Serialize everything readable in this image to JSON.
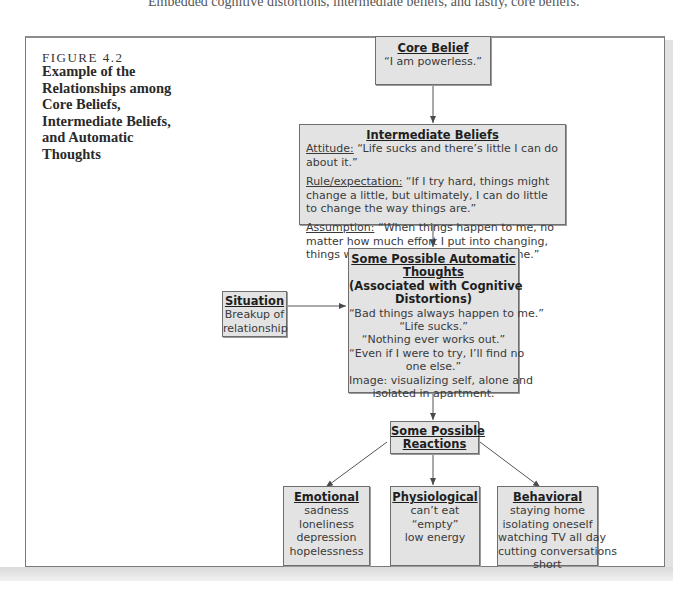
{
  "page": {
    "caption": "Embedded cognitive distortions, intermediate beliefs, and lastly, core beliefs."
  },
  "figure": {
    "label": "FIGURE 4.2",
    "title": "Example of the Relationships among Core Beliefs, Intermediate Beliefs, and Automatic Thoughts"
  },
  "diagram": {
    "core_belief": {
      "title": "Core Belief",
      "text": "“I am powerless.”"
    },
    "intermediate_beliefs": {
      "title": "Intermediate Beliefs",
      "items": [
        {
          "label": "Attitude:",
          "text": " “Life sucks and there’s little I can do about it.”"
        },
        {
          "label": "Rule/expectation:",
          "text": " “If I try hard, things might change a little, but ultimately, I can do little to change the way things are.”"
        },
        {
          "label": "Assumption:",
          "text": " “When things happen to me, no matter how much effort I put into changing, things will more or less remain the same.”"
        }
      ]
    },
    "situation": {
      "title": "Situation",
      "lines": [
        "Breakup of",
        "relationship"
      ]
    },
    "automatic_thoughts": {
      "title_lines": [
        "Some Possible Automatic",
        "Thoughts"
      ],
      "subtitle_lines": [
        "(Associated with Cognitive",
        "Distortions)"
      ],
      "lines": [
        "“Bad things always happen to me.”",
        "“Life sucks.”",
        "“Nothing ever works out.”",
        "“Even if I were to try, I’ll find no",
        "one else.”",
        "Image: visualizing self, alone and",
        "isolated in apartment."
      ]
    },
    "reactions": {
      "title_lines": [
        "Some Possible",
        "Reactions"
      ]
    },
    "emotional": {
      "title": "Emotional",
      "lines": [
        "sadness",
        "loneliness",
        "depression",
        "hopelessness"
      ]
    },
    "physiological": {
      "title": "Physiological",
      "lines": [
        "can’t eat",
        "“empty”",
        "low energy"
      ]
    },
    "behavioral": {
      "title": "Behavioral",
      "lines": [
        "staying home",
        "isolating oneself",
        "watching TV all day",
        "cutting conversations",
        "short"
      ]
    }
  },
  "colors": {
    "box_fill": "#e3e3e3",
    "box_border": "#6e6e6e",
    "connector": "#555555"
  }
}
